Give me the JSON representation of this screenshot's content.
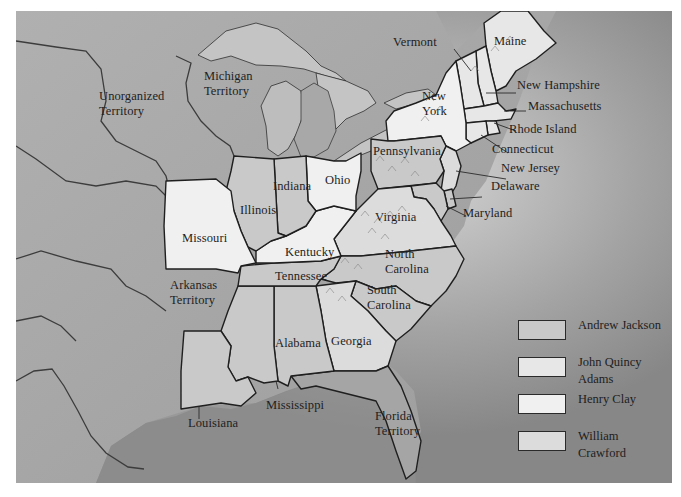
{
  "map": {
    "title": "Election of 1824",
    "territories": {
      "unorganized": "Unorganized\nTerritory",
      "michigan": "Michigan\nTerritory",
      "arkansas": "Arkansas\nTerritory",
      "florida": "Florida\nTerritory"
    },
    "states": {
      "maine": "Maine",
      "vermont": "Vermont",
      "new_hampshire": "New Hampshire",
      "massachusetts": "Massachusetts",
      "rhode_island": "Rhode Island",
      "connecticut": "Connecticut",
      "new_york": "New\nYork",
      "new_jersey": "New Jersey",
      "pennsylvania": "Pennsylvania",
      "delaware": "Delaware",
      "maryland": "Maryland",
      "virginia": "Virginia",
      "north_carolina": "North\nCarolina",
      "south_carolina": "South\nCarolina",
      "georgia": "Georgia",
      "ohio": "Ohio",
      "indiana": "Indiana",
      "illinois": "Illinois",
      "missouri": "Missouri",
      "kentucky": "Kentucky",
      "tennessee": "Tennessee",
      "alabama": "Alabama",
      "mississippi": "Mississippi",
      "louisiana": "Louisiana"
    }
  },
  "legend": {
    "items": [
      {
        "label": "Andrew Jackson",
        "color": "#c9c9c9"
      },
      {
        "label": "John Quincy\nAdams",
        "color": "#e7e7e7"
      },
      {
        "label": "Henry Clay",
        "color": "#f0f0f0"
      },
      {
        "label": "William\nCrawford",
        "color": "#dcdcdc"
      }
    ]
  },
  "colors": {
    "ocean": "#8a8a8a",
    "land": "#a9a9a9",
    "lake": "#c8c8c8",
    "border": "#1f1f1f",
    "jackson": "#c9c9c9",
    "adams": "#e7e7e7",
    "clay": "#f0f0f0",
    "crawford": "#dcdcdc",
    "territory": "#a5a5a5"
  }
}
